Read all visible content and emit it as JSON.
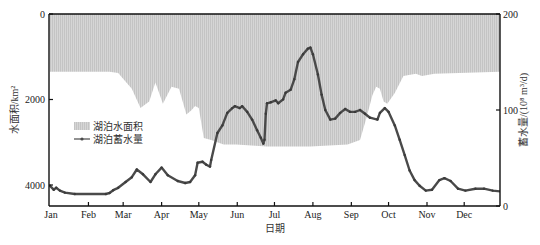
{
  "chart_data": {
    "type": "area+line",
    "title": "",
    "xlabel": "日期",
    "ylabel_left": "水面积/km²",
    "ylabel_right": "蓄水量/(10⁸ m³/d)",
    "x_categories": [
      "Jan",
      "Feb",
      "Mar",
      "Apr",
      "May",
      "Jun",
      "Jul",
      "Aug",
      "Sep",
      "Oct",
      "Nov",
      "Dec"
    ],
    "left_axis": {
      "ticks": [
        "0",
        "2000",
        "4000"
      ],
      "ylim": [
        0,
        4500
      ],
      "inverted": true
    },
    "right_axis": {
      "ticks": [
        "0",
        "100",
        "200"
      ],
      "ylim": [
        0,
        200
      ]
    },
    "legend": [
      {
        "label": "湖泊水面积",
        "style": "area"
      },
      {
        "label": "湖泊蓄水量",
        "style": "line-marker"
      }
    ],
    "series": [
      {
        "name": "湖泊水面积",
        "axis": "left",
        "unit": "km²",
        "points": [
          [
            0,
            1350
          ],
          [
            48,
            1350
          ],
          [
            55,
            1380
          ],
          [
            60,
            1550
          ],
          [
            66,
            1750
          ],
          [
            73,
            2200
          ],
          [
            80,
            2050
          ],
          [
            85,
            1600
          ],
          [
            91,
            2100
          ],
          [
            98,
            1700
          ],
          [
            104,
            1750
          ],
          [
            110,
            2350
          ],
          [
            114,
            2250
          ],
          [
            117,
            2150
          ],
          [
            120,
            2200
          ],
          [
            124,
            2900
          ],
          [
            130,
            2950
          ],
          [
            140,
            3050
          ],
          [
            150,
            3050
          ],
          [
            175,
            3100
          ],
          [
            210,
            3100
          ],
          [
            240,
            3050
          ],
          [
            250,
            2950
          ],
          [
            255,
            2450
          ],
          [
            260,
            1900
          ],
          [
            263,
            1700
          ],
          [
            266,
            1750
          ],
          [
            269,
            2050
          ],
          [
            272,
            2100
          ],
          [
            278,
            1850
          ],
          [
            285,
            1450
          ],
          [
            295,
            1400
          ],
          [
            300,
            1450
          ],
          [
            310,
            1400
          ],
          [
            365,
            1350
          ]
        ]
      },
      {
        "name": "湖泊蓄水量",
        "axis": "right",
        "unit": "10⁸ m³/d",
        "points": [
          [
            0,
            21
          ],
          [
            3,
            17
          ],
          [
            5,
            19
          ],
          [
            8,
            16
          ],
          [
            12,
            14
          ],
          [
            20,
            12.5
          ],
          [
            45,
            12.5
          ],
          [
            48,
            13.5
          ],
          [
            51,
            16.5
          ],
          [
            55,
            19
          ],
          [
            61,
            25
          ],
          [
            66,
            30
          ],
          [
            70,
            38
          ],
          [
            75,
            33
          ],
          [
            81,
            25
          ],
          [
            85,
            33
          ],
          [
            90,
            40
          ],
          [
            95,
            32
          ],
          [
            103,
            26
          ],
          [
            109,
            24
          ],
          [
            113,
            25
          ],
          [
            117,
            32
          ],
          [
            119,
            45
          ],
          [
            123,
            46
          ],
          [
            126,
            43
          ],
          [
            129,
            41
          ],
          [
            130,
            48
          ],
          [
            135,
            76
          ],
          [
            139,
            84
          ],
          [
            143,
            97
          ],
          [
            147,
            102
          ],
          [
            149,
            104
          ],
          [
            153,
            102
          ],
          [
            155,
            104
          ],
          [
            159,
            98
          ],
          [
            163,
            90
          ],
          [
            167,
            79
          ],
          [
            170,
            71
          ],
          [
            172,
            65
          ],
          [
            173,
            69
          ],
          [
            174,
            96
          ],
          [
            175,
            107
          ],
          [
            178,
            108
          ],
          [
            182,
            110
          ],
          [
            184,
            107
          ],
          [
            188,
            111
          ],
          [
            190,
            118
          ],
          [
            194,
            121
          ],
          [
            197,
            132
          ],
          [
            200,
            150
          ],
          [
            204,
            158
          ],
          [
            208,
            164
          ],
          [
            210,
            165
          ],
          [
            212,
            158
          ],
          [
            216,
            137
          ],
          [
            219,
            116
          ],
          [
            222,
            100
          ],
          [
            226,
            90
          ],
          [
            230,
            91
          ],
          [
            234,
            97
          ],
          [
            238,
            101
          ],
          [
            242,
            98
          ],
          [
            246,
            98
          ],
          [
            250,
            100
          ],
          [
            254,
            96
          ],
          [
            258,
            92
          ],
          [
            264,
            90
          ],
          [
            266,
            97
          ],
          [
            270,
            102
          ],
          [
            273,
            98
          ],
          [
            278,
            84
          ],
          [
            282,
            69
          ],
          [
            286,
            53
          ],
          [
            290,
            37
          ],
          [
            294,
            27
          ],
          [
            298,
            21
          ],
          [
            303,
            16
          ],
          [
            308,
            17
          ],
          [
            314,
            27
          ],
          [
            318,
            29
          ],
          [
            323,
            26
          ],
          [
            329,
            18
          ],
          [
            335,
            16
          ],
          [
            343,
            18
          ],
          [
            350,
            18
          ],
          [
            357,
            16
          ],
          [
            365,
            15
          ]
        ]
      }
    ]
  },
  "axes": {
    "left_ticks": [
      {
        "label": "0",
        "value": 0
      },
      {
        "label": "2000",
        "value": 2000
      },
      {
        "label": "4000",
        "value": 4000
      }
    ],
    "right_ticks": [
      {
        "label": "0",
        "value": 0
      },
      {
        "label": "100",
        "value": 100
      },
      {
        "label": "200",
        "value": 200
      }
    ],
    "x_ticks": [
      "Jan",
      "Feb",
      "Mar",
      "Apr",
      "May",
      "Jun",
      "Jul",
      "Aug",
      "Sep",
      "Oct",
      "Nov",
      "Dec"
    ],
    "xlabel": "日期",
    "ylabel_left": "水面积/km²",
    "ylabel_right": "蓄水量/(10⁸ m³/d)"
  },
  "legend": {
    "area_label": "湖泊水面积",
    "line_label": "湖泊蓄水量"
  },
  "colors": {
    "area_fill": "#d2d2d2",
    "area_stripe": "#bdbdbd",
    "line": "#4a4a4a",
    "axis": "#111111"
  }
}
